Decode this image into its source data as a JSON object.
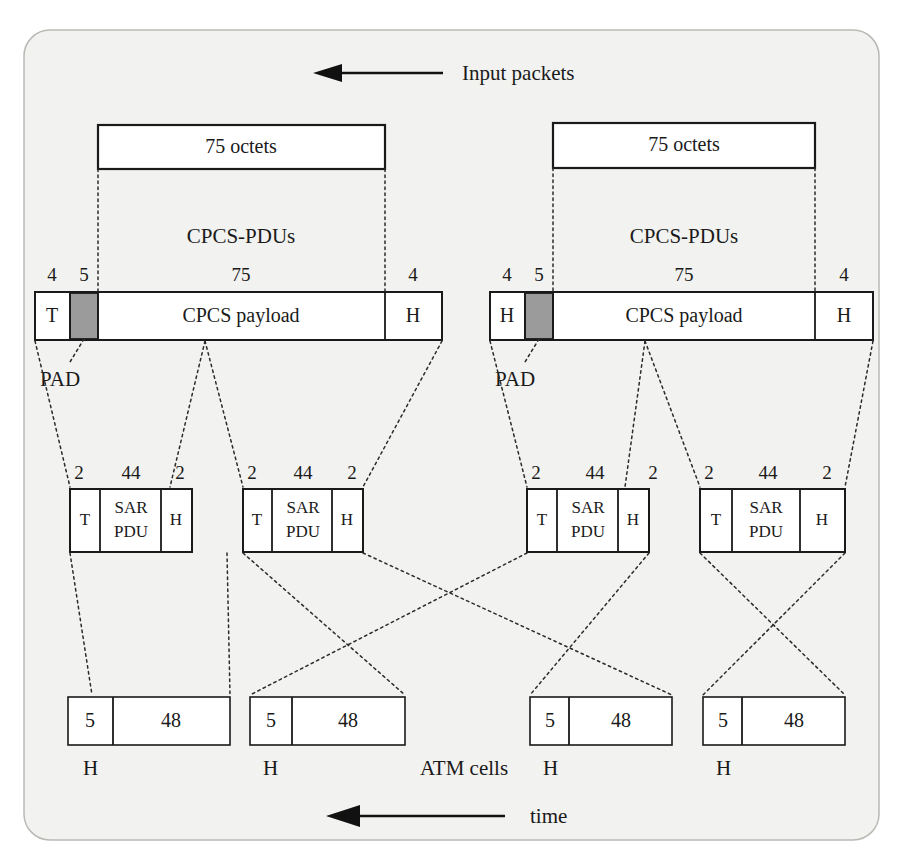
{
  "figure": {
    "title_arrow_label": "Input packets",
    "time_arrow_label": "time",
    "atm_cells_label": "ATM cells",
    "pad_label_left": "PAD",
    "pad_label_right": "PAD",
    "row_label_left": "CPCS-PDUs",
    "row_label_right": "CPCS-PDUs",
    "colors": {
      "panel_background": "#f2f2f0",
      "panel_border": "#b9b9b4",
      "box_stroke": "#1a1a1a",
      "box_fill": "#ffffff",
      "pad_fill": "#9b9b9b",
      "leader_line": "#2b2b2b",
      "arrow": "#111111"
    }
  },
  "input_packets": [
    {
      "label": "75 octets"
    },
    {
      "label": "75 octets"
    }
  ],
  "cpcs_pdus": [
    {
      "sizes": {
        "trailer": "4",
        "pad": "5",
        "payload": "75",
        "header": "4"
      },
      "cells": {
        "trailer": "T",
        "pad": "",
        "payload": "CPCS payload",
        "header": "H"
      }
    },
    {
      "sizes": {
        "trailer": "4",
        "pad": "5",
        "payload": "75",
        "header": "4"
      },
      "cells": {
        "trailer": "H",
        "pad": "",
        "payload": "CPCS payload",
        "header": "H"
      }
    }
  ],
  "sar_pdus": [
    {
      "sizes": {
        "trailer": "2",
        "payload": "44",
        "header": "2"
      },
      "cells": {
        "trailer": "T",
        "payload_line1": "SAR",
        "payload_line2": "PDU",
        "header": "H"
      }
    },
    {
      "sizes": {
        "trailer": "2",
        "payload": "44",
        "header": "2"
      },
      "cells": {
        "trailer": "T",
        "payload_line1": "SAR",
        "payload_line2": "PDU",
        "header": "H"
      }
    },
    {
      "sizes": {
        "trailer": "2",
        "payload": "44",
        "header": "2"
      },
      "cells": {
        "trailer": "T",
        "payload_line1": "SAR",
        "payload_line2": "PDU",
        "header": "H"
      }
    },
    {
      "sizes": {
        "trailer": "2",
        "payload": "44",
        "header": "2"
      },
      "cells": {
        "trailer": "T",
        "payload_line1": "SAR",
        "payload_line2": "PDU",
        "header": "H"
      }
    }
  ],
  "atm_cells": [
    {
      "header_size": "5",
      "payload_size": "48",
      "header_letter": "H"
    },
    {
      "header_size": "5",
      "payload_size": "48",
      "header_letter": "H"
    },
    {
      "header_size": "5",
      "payload_size": "48",
      "header_letter": "H"
    },
    {
      "header_size": "5",
      "payload_size": "48",
      "header_letter": "H"
    }
  ]
}
